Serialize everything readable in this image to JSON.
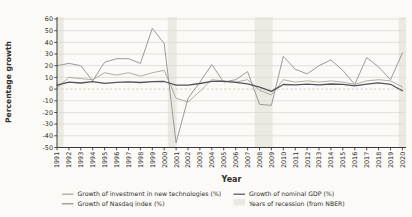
{
  "chart_data": {
    "type": "line",
    "title": "",
    "xlabel": "Year",
    "ylabel": "Percentage growth",
    "ylim": [
      -50,
      60
    ],
    "ytick_step": 10,
    "yticks": [
      60,
      50,
      40,
      30,
      20,
      10,
      0,
      -10,
      -20,
      -30,
      -40,
      -50
    ],
    "grid": "horizontal",
    "legend_position": "bottom-two-columns",
    "x": [
      1991,
      1992,
      1993,
      1994,
      1995,
      1996,
      1997,
      1998,
      1999,
      2000,
      2001,
      2002,
      2003,
      2004,
      2005,
      2006,
      2007,
      2008,
      2009,
      2010,
      2011,
      2012,
      2013,
      2014,
      2015,
      2016,
      2017,
      2018,
      2019,
      2020
    ],
    "series": [
      {
        "name": "Growth of investment in new technologies (%)",
        "color": "#a9a49b",
        "line_width": 0.9,
        "values": [
          1,
          10,
          9,
          8,
          14,
          12,
          14,
          11,
          14,
          16,
          -8,
          -11,
          -2,
          8,
          7,
          6,
          8,
          -1,
          -5,
          8,
          6,
          7,
          6,
          7,
          6,
          4,
          7,
          8,
          7,
          2
        ]
      },
      {
        "name": "Growth of Nasdaq index (%)",
        "color": "#909090",
        "line_width": 0.9,
        "values": [
          20,
          22,
          20,
          7,
          23,
          26,
          26,
          22,
          52,
          39,
          -46,
          -8,
          6,
          21,
          6,
          8,
          15,
          -13,
          -14,
          28,
          17,
          13,
          20,
          25,
          16,
          4,
          27,
          19,
          8,
          31
        ]
      },
      {
        "name": "Growth of nominal GDP (%)",
        "color": "#52525c",
        "line_width": 1.3,
        "values": [
          3.3,
          5.9,
          5.2,
          6.3,
          4.9,
          5.7,
          6.2,
          5.6,
          6.3,
          6.5,
          3.3,
          3.4,
          4.8,
          6.6,
          6.7,
          5.8,
          4.5,
          1.7,
          -2,
          3.9,
          3.7,
          4.2,
          3.6,
          4.4,
          4,
          2.7,
          4.2,
          5.4,
          4.1,
          -1.5
        ]
      }
    ],
    "recession_bands": {
      "label": "Years of recession (from NBER)",
      "color": "#ebeae2",
      "ranges": [
        [
          1991,
          1991.55
        ],
        [
          2000.3,
          2001.05
        ],
        [
          2007.6,
          2009.1
        ],
        [
          2019.7,
          2020.35
        ]
      ]
    },
    "colors": {
      "grid": "#d9d9d5",
      "zero_line": "#c6c6c1",
      "spine": "#3a3a3a",
      "tick_label": "#2e2e2e",
      "axis_title": "#1c1c1c",
      "legend_text": "#4f4f4f",
      "background": "#fbfaf6"
    }
  }
}
